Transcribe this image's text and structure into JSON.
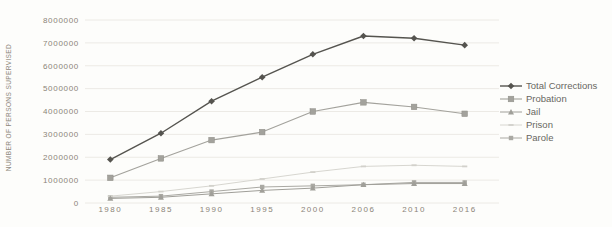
{
  "figure": {
    "background_color": "#fdfdfb",
    "grid_color": "#eceae5",
    "tick_label_color": "#8b8478",
    "legend_text_color": "#68675f"
  },
  "chart_data": {
    "type": "line",
    "title": "",
    "xlabel": "",
    "ylabel": "NUMBER OF PERSONS SUPERVISED",
    "categories": [
      "1980",
      "1985",
      "1990",
      "1995",
      "2000",
      "2006",
      "2010",
      "2016"
    ],
    "series": [
      {
        "name": "Total Corrections",
        "marker": "diamond",
        "color": "#55544f",
        "line_width": 1.4,
        "values": [
          1900000,
          3050000,
          4450000,
          5500000,
          6500000,
          7300000,
          7200000,
          6900000
        ]
      },
      {
        "name": "Probation",
        "marker": "square",
        "color": "#a3a29c",
        "line_width": 1.1,
        "values": [
          1100000,
          1950000,
          2750000,
          3100000,
          4000000,
          4400000,
          4200000,
          3900000
        ]
      },
      {
        "name": "Jail",
        "marker": "triangle",
        "color": "#a09f99",
        "line_width": 1.0,
        "values": [
          200000,
          250000,
          400000,
          550000,
          650000,
          800000,
          850000,
          850000
        ]
      },
      {
        "name": "Prison",
        "marker": "dash",
        "color": "#d2d1cb",
        "line_width": 0.9,
        "values": [
          300000,
          500000,
          750000,
          1050000,
          1350000,
          1600000,
          1650000,
          1600000
        ]
      },
      {
        "name": "Parole",
        "marker": "square-small",
        "color": "#aaa9a3",
        "line_width": 1.0,
        "values": [
          250000,
          300000,
          500000,
          700000,
          750000,
          800000,
          900000,
          900000
        ]
      }
    ],
    "ylim": [
      0,
      8000000
    ],
    "ytick_step": 1000000,
    "y_tick_labels": [
      "8000000",
      "7000000",
      "6000000",
      "5000000",
      "4000000",
      "3000000",
      "2000000",
      "1000000",
      "0"
    ],
    "grid": true,
    "legend_position": "right"
  }
}
